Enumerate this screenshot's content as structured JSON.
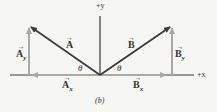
{
  "diagram": {
    "axes": {
      "x_label": "+x",
      "y_label": "+y"
    },
    "vectors": {
      "A": {
        "label": "A",
        "arrow": "→"
      },
      "B": {
        "label": "B",
        "arrow": "→"
      },
      "Ax": {
        "label": "A",
        "sub": "x",
        "arrow": "→"
      },
      "Ay": {
        "label": "A",
        "sub": "y",
        "arrow": "→"
      },
      "Bx": {
        "label": "B",
        "sub": "x",
        "arrow": "→"
      },
      "By": {
        "label": "B",
        "sub": "y",
        "arrow": "→"
      }
    },
    "angles": {
      "left": "θ",
      "right": "θ"
    },
    "caption": "(b)",
    "colors": {
      "background": "#f6f6f4",
      "vector": "#3a3a3a",
      "component": "#a8a8a8",
      "axis": "#3a3a3a"
    }
  }
}
